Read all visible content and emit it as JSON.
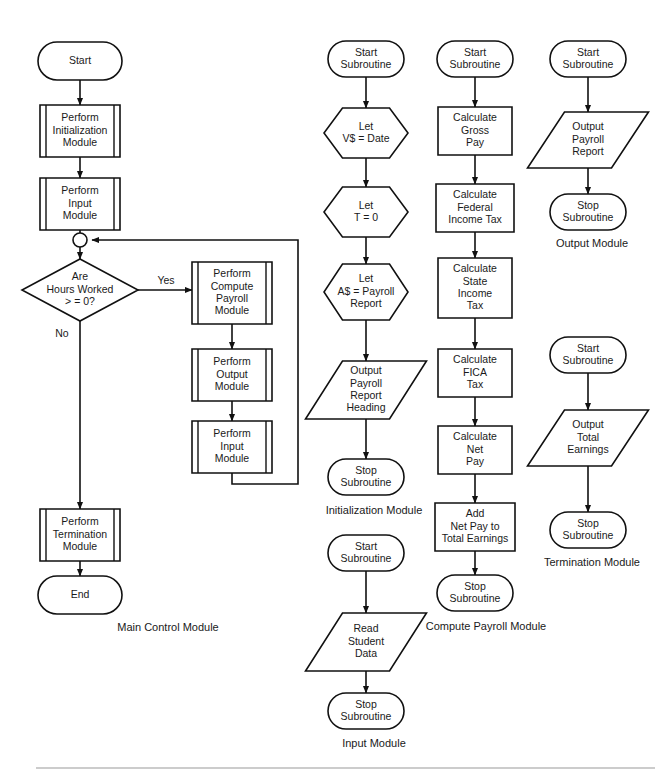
{
  "diagram": {
    "stroke_color": "#111111",
    "fill_color": "#ffffff",
    "text_color": "#1a1a1a",
    "footer_rule_color": "#9a9a9a"
  },
  "modules": [
    {
      "id": "main-control-module",
      "caption": "Main Control Module",
      "caption_x": 168,
      "caption_y": 628,
      "nodes": [
        {
          "id": "main-start",
          "kind": "terminator",
          "cx": 80,
          "cy": 61,
          "w": 84,
          "h": 38,
          "lines": [
            "Start"
          ]
        },
        {
          "id": "main-init",
          "kind": "predefined-process",
          "cx": 80,
          "cy": 131,
          "w": 80,
          "h": 52,
          "lines": [
            "Perform",
            "Initialization",
            "Module"
          ]
        },
        {
          "id": "main-input",
          "kind": "predefined-process",
          "cx": 80,
          "cy": 204,
          "w": 80,
          "h": 52,
          "lines": [
            "Perform",
            "Input",
            "Module"
          ]
        },
        {
          "id": "main-junction",
          "kind": "connector",
          "cx": 80,
          "cy": 240,
          "w": 14,
          "h": 14,
          "lines": []
        },
        {
          "id": "main-decision",
          "kind": "decision",
          "cx": 80,
          "cy": 290,
          "w": 116,
          "h": 62,
          "lines": [
            "Are",
            "Hours Worked",
            "> = 0?"
          ]
        },
        {
          "id": "main-compute",
          "kind": "predefined-process",
          "cx": 232,
          "cy": 293,
          "w": 80,
          "h": 62,
          "lines": [
            "Perform",
            "Compute",
            "Payroll",
            "Module"
          ]
        },
        {
          "id": "main-output",
          "kind": "predefined-process",
          "cx": 232,
          "cy": 375,
          "w": 80,
          "h": 52,
          "lines": [
            "Perform",
            "Output",
            "Module"
          ]
        },
        {
          "id": "main-input-2",
          "kind": "predefined-process",
          "cx": 232,
          "cy": 447,
          "w": 80,
          "h": 52,
          "lines": [
            "Perform",
            "Input",
            "Module"
          ]
        },
        {
          "id": "main-termination",
          "kind": "predefined-process",
          "cx": 80,
          "cy": 535,
          "w": 80,
          "h": 52,
          "lines": [
            "Perform",
            "Termination",
            "Module"
          ]
        },
        {
          "id": "main-end",
          "kind": "terminator",
          "cx": 80,
          "cy": 595,
          "w": 84,
          "h": 38,
          "lines": [
            "End"
          ]
        }
      ],
      "edges": [
        {
          "id": "e-start-init",
          "points": [
            [
              80,
              80
            ],
            [
              80,
              105
            ]
          ],
          "arrow": true
        },
        {
          "id": "e-init-input",
          "points": [
            [
              80,
              157
            ],
            [
              80,
              178
            ]
          ],
          "arrow": true
        },
        {
          "id": "e-input-junction",
          "points": [
            [
              80,
              230
            ],
            [
              80,
              233
            ]
          ],
          "arrow": false
        },
        {
          "id": "e-junction-dec",
          "points": [
            [
              80,
              247
            ],
            [
              80,
              259
            ]
          ],
          "arrow": true
        },
        {
          "id": "e-dec-yes",
          "points": [
            [
              138,
              290
            ],
            [
              192,
              290
            ]
          ],
          "arrow": true
        },
        {
          "id": "e-compute-output",
          "points": [
            [
              232,
              324
            ],
            [
              232,
              349
            ]
          ],
          "arrow": true
        },
        {
          "id": "e-output-input2",
          "points": [
            [
              232,
              401
            ],
            [
              232,
              421
            ]
          ],
          "arrow": true
        },
        {
          "id": "e-loop-back",
          "points": [
            [
              232,
              473
            ],
            [
              232,
              484
            ],
            [
              298,
              484
            ],
            [
              298,
              240
            ],
            [
              92,
              240
            ]
          ],
          "arrow": true
        },
        {
          "id": "e-dec-no",
          "points": [
            [
              80,
              321
            ],
            [
              80,
              509
            ]
          ],
          "arrow": true
        },
        {
          "id": "e-term-end",
          "points": [
            [
              80,
              561
            ],
            [
              80,
              576
            ]
          ],
          "arrow": true
        }
      ],
      "branch_labels": [
        {
          "id": "yes-label",
          "text": "Yes",
          "x": 166,
          "y": 281
        },
        {
          "id": "no-label",
          "text": "No",
          "x": 62,
          "y": 334
        }
      ]
    },
    {
      "id": "initialization-module",
      "caption": "Initialization Module",
      "caption_x": 374,
      "caption_y": 511,
      "nodes": [
        {
          "id": "init-start",
          "kind": "terminator",
          "cx": 366,
          "cy": 59,
          "w": 76,
          "h": 36,
          "lines": [
            "Start",
            "Subroutine"
          ]
        },
        {
          "id": "init-let-v",
          "kind": "preparation",
          "cx": 366,
          "cy": 133,
          "w": 84,
          "h": 50,
          "lines": [
            "Let",
            "V$ = Date"
          ]
        },
        {
          "id": "init-let-t",
          "kind": "preparation",
          "cx": 366,
          "cy": 212,
          "w": 84,
          "h": 50,
          "lines": [
            "Let",
            "T = 0"
          ]
        },
        {
          "id": "init-let-a",
          "kind": "preparation",
          "cx": 366,
          "cy": 292,
          "w": 84,
          "h": 56,
          "lines": [
            "Let",
            "A$ = Payroll",
            "Report"
          ]
        },
        {
          "id": "init-output",
          "kind": "input-output",
          "cx": 366,
          "cy": 390,
          "w": 84,
          "h": 58,
          "lines": [
            "Output",
            "Payroll",
            "Report",
            "Heading"
          ]
        },
        {
          "id": "init-stop",
          "kind": "terminator",
          "cx": 366,
          "cy": 477,
          "w": 76,
          "h": 36,
          "lines": [
            "Stop",
            "Subroutine"
          ]
        }
      ],
      "edges": [
        {
          "id": "e-init-1",
          "points": [
            [
              366,
              77
            ],
            [
              366,
              108
            ]
          ],
          "arrow": true
        },
        {
          "id": "e-init-2",
          "points": [
            [
              366,
              158
            ],
            [
              366,
              187
            ]
          ],
          "arrow": true
        },
        {
          "id": "e-init-3",
          "points": [
            [
              366,
              237
            ],
            [
              366,
              264
            ]
          ],
          "arrow": true
        },
        {
          "id": "e-init-4",
          "points": [
            [
              366,
              320
            ],
            [
              366,
              361
            ]
          ],
          "arrow": true
        },
        {
          "id": "e-init-5",
          "points": [
            [
              366,
              419
            ],
            [
              366,
              459
            ]
          ],
          "arrow": true
        }
      ],
      "branch_labels": []
    },
    {
      "id": "input-module",
      "caption": "Input Module",
      "caption_x": 374,
      "caption_y": 744,
      "nodes": [
        {
          "id": "inp-start",
          "kind": "terminator",
          "cx": 366,
          "cy": 553,
          "w": 76,
          "h": 36,
          "lines": [
            "Start",
            "Subroutine"
          ]
        },
        {
          "id": "inp-read",
          "kind": "input-output",
          "cx": 366,
          "cy": 642,
          "w": 84,
          "h": 58,
          "lines": [
            "Read",
            "Student",
            "Data"
          ]
        },
        {
          "id": "inp-stop",
          "kind": "terminator",
          "cx": 366,
          "cy": 711,
          "w": 76,
          "h": 36,
          "lines": [
            "Stop",
            "Subroutine"
          ]
        }
      ],
      "edges": [
        {
          "id": "e-inp-1",
          "points": [
            [
              366,
              571
            ],
            [
              366,
              613
            ]
          ],
          "arrow": true
        },
        {
          "id": "e-inp-2",
          "points": [
            [
              366,
              671
            ],
            [
              366,
              693
            ]
          ],
          "arrow": true
        }
      ],
      "branch_labels": []
    },
    {
      "id": "compute-payroll-module",
      "caption": "Compute Payroll Module",
      "caption_x": 486,
      "caption_y": 627,
      "nodes": [
        {
          "id": "cp-start",
          "kind": "terminator",
          "cx": 475,
          "cy": 59,
          "w": 76,
          "h": 36,
          "lines": [
            "Start",
            "Subroutine"
          ]
        },
        {
          "id": "cp-gross",
          "kind": "process",
          "cx": 475,
          "cy": 131,
          "w": 74,
          "h": 48,
          "lines": [
            "Calculate",
            "Gross",
            "Pay"
          ]
        },
        {
          "id": "cp-federal",
          "kind": "process",
          "cx": 475,
          "cy": 208,
          "w": 78,
          "h": 48,
          "lines": [
            "Calculate",
            "Federal",
            "Income Tax"
          ]
        },
        {
          "id": "cp-state",
          "kind": "process",
          "cx": 475,
          "cy": 288,
          "w": 74,
          "h": 60,
          "lines": [
            "Calculate",
            "State",
            "Income",
            "Tax"
          ]
        },
        {
          "id": "cp-fica",
          "kind": "process",
          "cx": 475,
          "cy": 373,
          "w": 74,
          "h": 48,
          "lines": [
            "Calculate",
            "FICA",
            "Tax"
          ]
        },
        {
          "id": "cp-net",
          "kind": "process",
          "cx": 475,
          "cy": 450,
          "w": 74,
          "h": 48,
          "lines": [
            "Calculate",
            "Net",
            "Pay"
          ]
        },
        {
          "id": "cp-add",
          "kind": "process",
          "cx": 475,
          "cy": 527,
          "w": 80,
          "h": 48,
          "lines": [
            "Add",
            "Net Pay to",
            "Total Earnings"
          ]
        },
        {
          "id": "cp-stop",
          "kind": "terminator",
          "cx": 475,
          "cy": 593,
          "w": 76,
          "h": 36,
          "lines": [
            "Stop",
            "Subroutine"
          ]
        }
      ],
      "edges": [
        {
          "id": "e-cp-1",
          "points": [
            [
              475,
              77
            ],
            [
              475,
              107
            ]
          ],
          "arrow": true
        },
        {
          "id": "e-cp-2",
          "points": [
            [
              475,
              155
            ],
            [
              475,
              184
            ]
          ],
          "arrow": true
        },
        {
          "id": "e-cp-3",
          "points": [
            [
              475,
              232
            ],
            [
              475,
              258
            ]
          ],
          "arrow": true
        },
        {
          "id": "e-cp-4",
          "points": [
            [
              475,
              318
            ],
            [
              475,
              349
            ]
          ],
          "arrow": true
        },
        {
          "id": "e-cp-5",
          "points": [
            [
              475,
              397
            ],
            [
              475,
              426
            ]
          ],
          "arrow": true
        },
        {
          "id": "e-cp-6",
          "points": [
            [
              475,
              474
            ],
            [
              475,
              503
            ]
          ],
          "arrow": true
        },
        {
          "id": "e-cp-7",
          "points": [
            [
              475,
              551
            ],
            [
              475,
              575
            ]
          ],
          "arrow": true
        }
      ],
      "branch_labels": []
    },
    {
      "id": "output-module",
      "caption": "Output Module",
      "caption_x": 592,
      "caption_y": 244,
      "nodes": [
        {
          "id": "out-start",
          "kind": "terminator",
          "cx": 588,
          "cy": 59,
          "w": 76,
          "h": 36,
          "lines": [
            "Start",
            "Subroutine"
          ]
        },
        {
          "id": "out-report",
          "kind": "input-output",
          "cx": 588,
          "cy": 140,
          "w": 84,
          "h": 56,
          "lines": [
            "Output",
            "Payroll",
            "Report"
          ]
        },
        {
          "id": "out-stop",
          "kind": "terminator",
          "cx": 588,
          "cy": 212,
          "w": 76,
          "h": 36,
          "lines": [
            "Stop",
            "Subroutine"
          ]
        }
      ],
      "edges": [
        {
          "id": "e-out-1",
          "points": [
            [
              588,
              77
            ],
            [
              588,
              112
            ]
          ],
          "arrow": true
        },
        {
          "id": "e-out-2",
          "points": [
            [
              588,
              168
            ],
            [
              588,
              194
            ]
          ],
          "arrow": true
        }
      ],
      "branch_labels": []
    },
    {
      "id": "termination-module",
      "caption": "Termination Module",
      "caption_x": 592,
      "caption_y": 563,
      "nodes": [
        {
          "id": "trm-start",
          "kind": "terminator",
          "cx": 588,
          "cy": 355,
          "w": 76,
          "h": 36,
          "lines": [
            "Start",
            "Subroutine"
          ]
        },
        {
          "id": "trm-earnings",
          "kind": "input-output",
          "cx": 588,
          "cy": 438,
          "w": 84,
          "h": 56,
          "lines": [
            "Output",
            "Total",
            "Earnings"
          ]
        },
        {
          "id": "trm-stop",
          "kind": "terminator",
          "cx": 588,
          "cy": 530,
          "w": 76,
          "h": 36,
          "lines": [
            "Stop",
            "Subroutine"
          ]
        }
      ],
      "edges": [
        {
          "id": "e-trm-1",
          "points": [
            [
              588,
              373
            ],
            [
              588,
              410
            ]
          ],
          "arrow": true
        },
        {
          "id": "e-trm-2",
          "points": [
            [
              588,
              466
            ],
            [
              588,
              512
            ]
          ],
          "arrow": true
        }
      ],
      "branch_labels": []
    }
  ],
  "footer": {
    "rule_x1": 36,
    "rule_x2": 655,
    "rule_y": 768
  }
}
